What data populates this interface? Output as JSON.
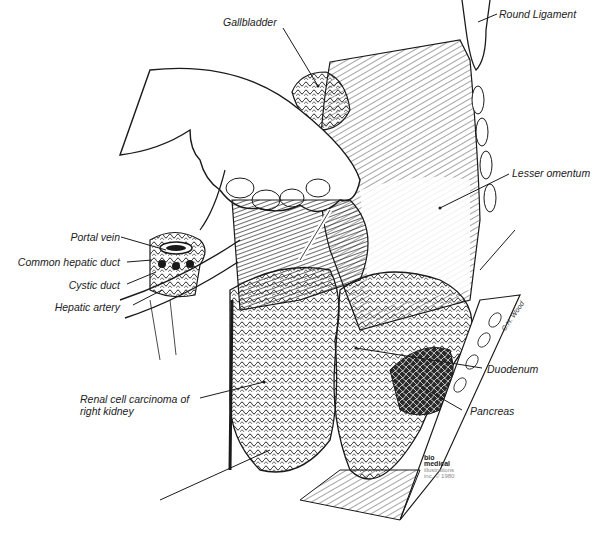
{
  "figure": {
    "labels": [
      {
        "id": "gallbladder",
        "text": "Gallbladder"
      },
      {
        "id": "round_ligament",
        "text": "Round Ligament"
      },
      {
        "id": "lesser_omentum",
        "text": "Lesser omentum"
      },
      {
        "id": "portal_vein",
        "text": "Portal vein"
      },
      {
        "id": "common_hepatic_duct",
        "text": "Common hepatic duct"
      },
      {
        "id": "cystic_duct",
        "text": "Cystic duct"
      },
      {
        "id": "hepatic_artery",
        "text": "Hepatic artery"
      },
      {
        "id": "renal_cell_carcinoma_line1",
        "text": "Renal cell carcinoma of"
      },
      {
        "id": "renal_cell_carcinoma_line2",
        "text": "right kidney"
      },
      {
        "id": "duodenum",
        "text": "Duodenum"
      },
      {
        "id": "pancreas",
        "text": "Pancreas"
      }
    ],
    "credit": {
      "line1": "bio",
      "line2": "medical",
      "line3": "illustrations",
      "line4": "inc. © 1980"
    },
    "signature": "C.H. Wood",
    "colors": {
      "ink": "#1a1a1a",
      "background": "#ffffff",
      "credit_gray": "#888888"
    }
  }
}
